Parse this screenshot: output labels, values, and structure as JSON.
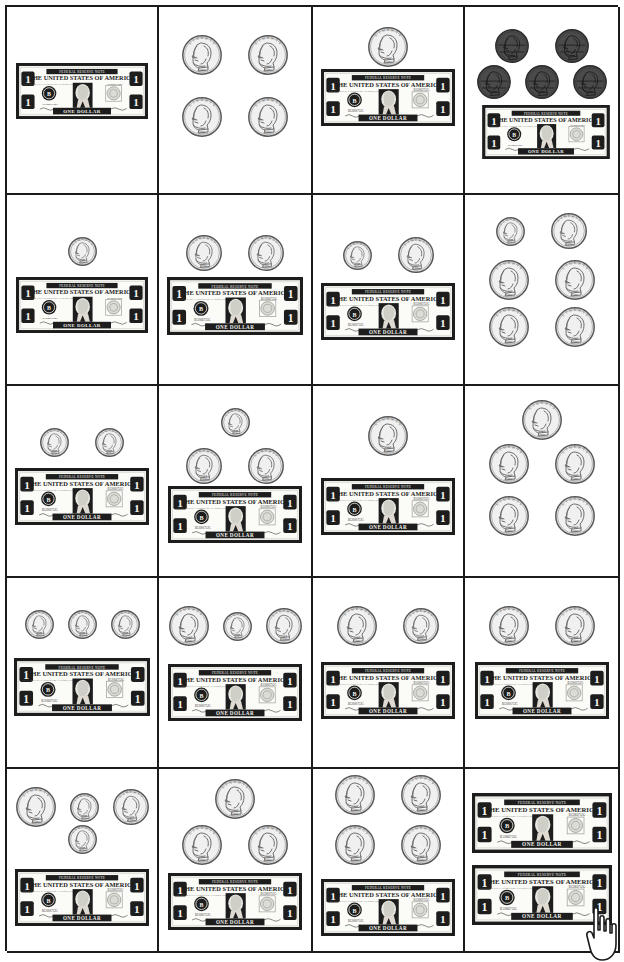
{
  "worksheet": {
    "title": "Counting Money Worksheet",
    "grid": {
      "columns": 4,
      "rows": 5,
      "cell_count": 20
    },
    "coin_names": {
      "penny": "penny",
      "nickel": "nickel",
      "dime": "dime",
      "quarter": "quarter",
      "dollar": "one-dollar-bill"
    },
    "coin_labels": {
      "liberty": "LIBERTY",
      "in_god_we_trust": "IN GOD WE TRUST",
      "year": "1995"
    },
    "bill_text": {
      "top_band": "FEDERAL RESERVE NOTE",
      "heading": "THE UNITED STATES OF AMERICA",
      "subheading": "THIS NOTE IS LEGAL TENDER FOR ALL DEBTS, PUBLIC AND PRIVATE",
      "serial": "B12066752G",
      "bottom_band": "ONE DOLLAR",
      "corner_numeral": "1",
      "seal_letter": "B",
      "signature_left": "Treasurer of the United States",
      "signature_right": "Secretary of the Treasury"
    },
    "colors": {
      "border": "#1b1b1b",
      "bill_ink": "#1d1d1d",
      "bill_paper": "#f3f3ef",
      "silver_coin": "#f0f0f0",
      "silver_edge": "#585858",
      "penny_face": "#4a4a4a",
      "penny_edge": "#2a2a2a",
      "background": "#ffffff"
    },
    "cursor": {
      "name": "hand-pointer-cursor",
      "visible": true
    }
  },
  "cells": [
    {
      "index": 1,
      "row": 1,
      "col": 1,
      "items": {
        "dollars": 1,
        "quarters": 0,
        "dimes": 0,
        "nickels": 0,
        "pennies": 0
      },
      "value": "$1.00",
      "coin_rows": []
    },
    {
      "index": 2,
      "row": 1,
      "col": 2,
      "items": {
        "dollars": 0,
        "quarters": 4,
        "dimes": 0,
        "nickels": 0,
        "pennies": 0
      },
      "value": "$1.00",
      "coin_rows": [
        [
          "quarter",
          "quarter"
        ],
        [
          "quarter",
          "quarter"
        ]
      ]
    },
    {
      "index": 3,
      "row": 1,
      "col": 3,
      "items": {
        "dollars": 1,
        "quarters": 1,
        "dimes": 0,
        "nickels": 0,
        "pennies": 0
      },
      "value": "$1.25",
      "coin_rows": [
        [
          "quarter"
        ]
      ]
    },
    {
      "index": 4,
      "row": 1,
      "col": 4,
      "items": {
        "dollars": 1,
        "quarters": 0,
        "dimes": 0,
        "nickels": 0,
        "pennies": 5
      },
      "value": "$1.05",
      "coin_rows": [
        [
          "penny",
          "penny"
        ],
        [
          "penny",
          "penny",
          "penny"
        ]
      ]
    },
    {
      "index": 5,
      "row": 2,
      "col": 1,
      "items": {
        "dollars": 1,
        "quarters": 0,
        "dimes": 1,
        "nickels": 0,
        "pennies": 0
      },
      "value": "$1.10",
      "coin_rows": [
        [
          "dime"
        ]
      ]
    },
    {
      "index": 6,
      "row": 2,
      "col": 2,
      "items": {
        "dollars": 1,
        "quarters": 0,
        "dimes": 0,
        "nickels": 2,
        "pennies": 0
      },
      "value": "$1.10",
      "coin_rows": [
        [
          "nickel",
          "nickel"
        ]
      ]
    },
    {
      "index": 7,
      "row": 2,
      "col": 3,
      "items": {
        "dollars": 1,
        "quarters": 0,
        "dimes": 1,
        "nickels": 1,
        "pennies": 0
      },
      "value": "$1.15",
      "coin_rows": [
        [
          "dime",
          "nickel"
        ]
      ]
    },
    {
      "index": 8,
      "row": 2,
      "col": 4,
      "items": {
        "dollars": 0,
        "quarters": 4,
        "dimes": 1,
        "nickels": 1,
        "pennies": 0
      },
      "value": "$1.15",
      "coin_rows": [
        [
          "dime",
          "nickel"
        ],
        [
          "quarter",
          "quarter"
        ],
        [
          "quarter",
          "quarter"
        ]
      ]
    },
    {
      "index": 9,
      "row": 3,
      "col": 1,
      "items": {
        "dollars": 1,
        "quarters": 0,
        "dimes": 2,
        "nickels": 0,
        "pennies": 0
      },
      "value": "$1.20",
      "coin_rows": [
        [
          "dime",
          "dime"
        ]
      ]
    },
    {
      "index": 10,
      "row": 3,
      "col": 2,
      "items": {
        "dollars": 1,
        "quarters": 0,
        "dimes": 1,
        "nickels": 2,
        "pennies": 0
      },
      "value": "$1.20",
      "coin_rows": [
        [
          "dime"
        ],
        [
          "nickel",
          "nickel"
        ]
      ]
    },
    {
      "index": 11,
      "row": 3,
      "col": 3,
      "items": {
        "dollars": 1,
        "quarters": 1,
        "dimes": 0,
        "nickels": 0,
        "pennies": 0
      },
      "value": "$1.25",
      "coin_rows": [
        [
          "quarter"
        ]
      ]
    },
    {
      "index": 12,
      "row": 3,
      "col": 4,
      "items": {
        "dollars": 0,
        "quarters": 5,
        "dimes": 0,
        "nickels": 0,
        "pennies": 0
      },
      "value": "$1.25",
      "coin_rows": [
        [
          "quarter"
        ],
        [
          "quarter",
          "quarter"
        ],
        [
          "quarter",
          "quarter"
        ]
      ]
    },
    {
      "index": 13,
      "row": 4,
      "col": 1,
      "items": {
        "dollars": 1,
        "quarters": 0,
        "dimes": 3,
        "nickels": 0,
        "pennies": 0
      },
      "value": "$1.30",
      "coin_rows": [
        [
          "dime",
          "dime",
          "dime"
        ]
      ]
    },
    {
      "index": 14,
      "row": 4,
      "col": 2,
      "items": {
        "dollars": 1,
        "quarters": 1,
        "dimes": 1,
        "nickels": 1,
        "pennies": 0
      },
      "value": "$1.40",
      "coin_rows": [
        [
          "quarter",
          "dime",
          "nickel"
        ]
      ]
    },
    {
      "index": 15,
      "row": 4,
      "col": 3,
      "items": {
        "dollars": 1,
        "quarters": 1,
        "dimes": 0,
        "nickels": 1,
        "pennies": 0
      },
      "value": "$1.30",
      "coin_rows": [
        [
          "quarter",
          "nickel"
        ]
      ]
    },
    {
      "index": 16,
      "row": 4,
      "col": 4,
      "items": {
        "dollars": 1,
        "quarters": 2,
        "dimes": 0,
        "nickels": 0,
        "pennies": 0
      },
      "value": "$1.50",
      "coin_rows": [
        [
          "quarter",
          "quarter"
        ]
      ]
    },
    {
      "index": 17,
      "row": 5,
      "col": 1,
      "items": {
        "dollars": 1,
        "quarters": 1,
        "dimes": 2,
        "nickels": 1,
        "pennies": 0
      },
      "value": "$1.55",
      "coin_rows": [
        [
          "quarter",
          "dime",
          "nickel"
        ],
        [
          "dime"
        ]
      ]
    },
    {
      "index": 18,
      "row": 5,
      "col": 2,
      "items": {
        "dollars": 1,
        "quarters": 3,
        "dimes": 0,
        "nickels": 0,
        "pennies": 0
      },
      "value": "$1.75",
      "coin_rows": [
        [
          "quarter"
        ],
        [
          "quarter",
          "quarter"
        ]
      ]
    },
    {
      "index": 19,
      "row": 5,
      "col": 3,
      "items": {
        "dollars": 1,
        "quarters": 4,
        "dimes": 0,
        "nickels": 0,
        "pennies": 0
      },
      "value": "$2.00",
      "coin_rows": [
        [
          "quarter",
          "quarter"
        ],
        [
          "quarter",
          "quarter"
        ]
      ]
    },
    {
      "index": 20,
      "row": 5,
      "col": 4,
      "items": {
        "dollars": 2,
        "quarters": 0,
        "dimes": 0,
        "nickels": 0,
        "pennies": 0
      },
      "value": "$2.00",
      "coin_rows": []
    }
  ]
}
